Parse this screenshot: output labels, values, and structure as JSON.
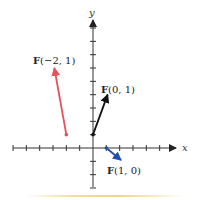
{
  "diagram": {
    "axes": {
      "x_label": "x",
      "y_label": "y",
      "origin_px": [
        93,
        148
      ],
      "unit_px": 13.33,
      "x_ticks": [
        -6,
        -5,
        -4,
        -3,
        -2,
        -1,
        1,
        2,
        3,
        4,
        5
      ],
      "y_ticks": [
        -3,
        -2,
        -1,
        1,
        2,
        3,
        4,
        5,
        6,
        7,
        8,
        9
      ],
      "x_range": [
        -6,
        6.2
      ],
      "y_range": [
        -3,
        9.6
      ],
      "axis_color": "#333333"
    },
    "vectors": [
      {
        "name": "F(-2, 1)",
        "label_bold": "F",
        "label_rest": "(−2, 1)",
        "tail": [
          -2,
          1
        ],
        "head": [
          -2.9,
          6
        ],
        "color": "#e8505b"
      },
      {
        "name": "F(0, 1)",
        "label_bold": "F",
        "label_rest": "(0, 1)",
        "tail": [
          0,
          1
        ],
        "head": [
          1.1,
          4
        ],
        "color": "#111111"
      },
      {
        "name": "F(1, 0)",
        "label_bold": "F",
        "label_rest": "(1, 0)",
        "tail": [
          1,
          0
        ],
        "head": [
          2.1,
          -0.9
        ],
        "color": "#1f4fb0"
      }
    ]
  }
}
